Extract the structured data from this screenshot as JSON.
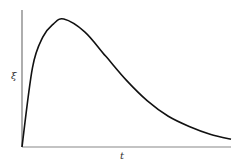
{
  "chart_data": {
    "type": "line",
    "title": "",
    "xlabel": "t",
    "ylabel": "ξ",
    "grid": false,
    "legend": null,
    "x_ticks": [],
    "y_ticks": [],
    "series": [
      {
        "name": "ξ(t)",
        "color": "#111111",
        "x": [
          0,
          0.05,
          0.1,
          0.15,
          0.2,
          0.3,
          0.4,
          0.5,
          0.6,
          0.7,
          0.8,
          0.9,
          1.0
        ],
        "y": [
          0,
          0.62,
          0.86,
          0.96,
          1.0,
          0.9,
          0.71,
          0.52,
          0.36,
          0.24,
          0.16,
          0.1,
          0.06
        ]
      }
    ]
  },
  "axes": {
    "x_label": "t",
    "y_label": "ξ"
  }
}
